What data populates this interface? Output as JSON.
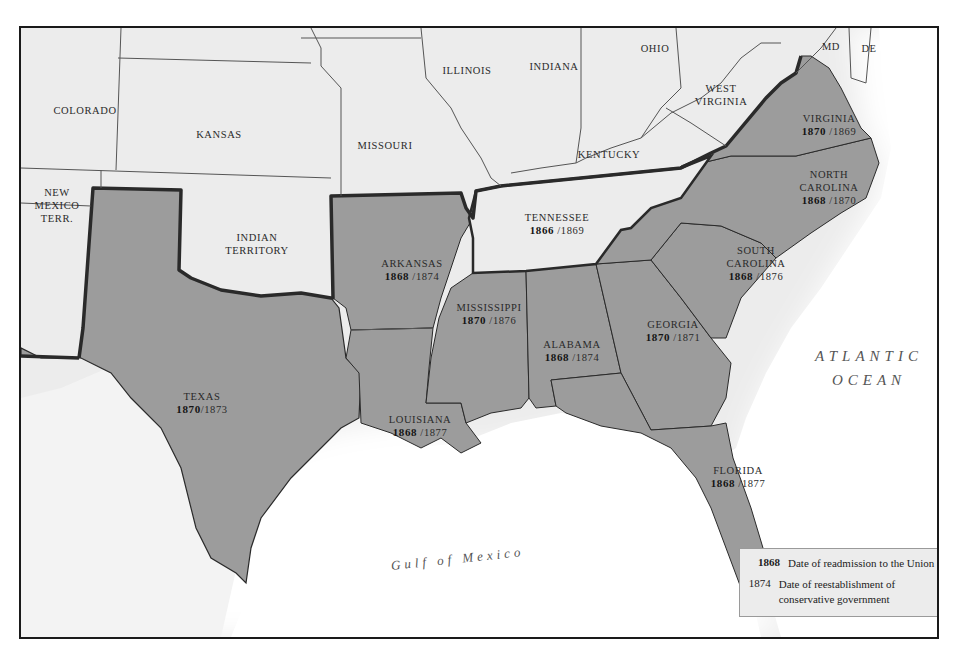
{
  "map": {
    "title": "Reconstruction in the South",
    "colors": {
      "union_fill": "#ececec",
      "confederate_fill": "#9c9c9c",
      "ocean": "#ffffff",
      "border": "#1a1a1a",
      "state_line": "#555555"
    },
    "non_confederate_labels": {
      "colorado": "COLORADO",
      "kansas": "KANSAS",
      "missouri": "MISSOURI",
      "illinois": "ILLINOIS",
      "indiana": "INDIANA",
      "ohio": "OHIO",
      "kentucky": "KENTUCKY",
      "west_virginia_1": "WEST",
      "west_virginia_2": "VIRGINIA",
      "maryland": "MD",
      "delaware": "DE",
      "new_mexico_1": "NEW",
      "new_mexico_2": "MEXICO",
      "new_mexico_3": "TERR.",
      "indian_territory_1": "INDIAN",
      "indian_territory_2": "TERRITORY"
    },
    "states": {
      "tennessee": {
        "name": "TENNESSEE",
        "readmission": "1866",
        "conservative": "/1869"
      },
      "virginia": {
        "name": "VIRGINIA",
        "readmission": "1870",
        "conservative": "/1869"
      },
      "north_carolina": {
        "name1": "NORTH",
        "name2": "CAROLINA",
        "readmission": "1868",
        "conservative": "/1870"
      },
      "south_carolina": {
        "name1": "SOUTH",
        "name2": "CAROLINA",
        "readmission": "1868",
        "conservative": "/1876"
      },
      "arkansas": {
        "name": "ARKANSAS",
        "readmission": "1868",
        "conservative": "/1874"
      },
      "mississippi": {
        "name": "MISSISSIPPI",
        "readmission": "1870",
        "conservative": "/1876"
      },
      "alabama": {
        "name": "ALABAMA",
        "readmission": "1868",
        "conservative": "/1874"
      },
      "georgia": {
        "name": "GEORGIA",
        "readmission": "1870",
        "conservative": "/1871"
      },
      "texas": {
        "name": "TEXAS",
        "readmission": "1870",
        "conservative": "/1873"
      },
      "louisiana": {
        "name": "LOUISIANA",
        "readmission": "1868",
        "conservative": "/1877"
      },
      "florida": {
        "name": "FLORIDA",
        "readmission": "1868",
        "conservative": "/1877"
      }
    },
    "water": {
      "atlantic_1": "ATLANTIC",
      "atlantic_2": "OCEAN",
      "gulf": "Gulf  of  Mexico"
    },
    "legend": {
      "items": [
        {
          "year": "1868",
          "description": "Date of readmission to the Union"
        },
        {
          "year": "1874",
          "description_1": "Date of reestablishment of",
          "description_2": "conservative government"
        }
      ]
    }
  }
}
